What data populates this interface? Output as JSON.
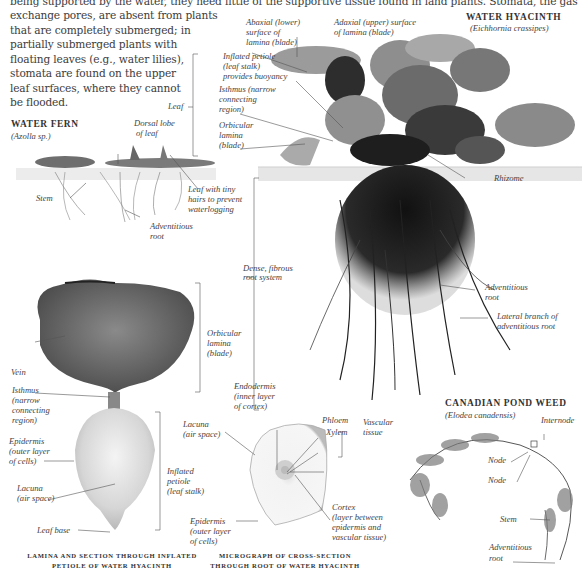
{
  "intro_text": {
    "lines": [
      "being supported by the water, they need little of the supportive tissue found in land plants. Stomata, the gas",
      "exchange pores, are absent from plants",
      "that are completely submerged; in",
      "partially submerged plants with",
      "floating leaves (e.g., water lilies),",
      "stomata are found on the upper",
      "leaf surfaces, where they cannot",
      "be flooded."
    ]
  },
  "water_hyacinth": {
    "title": "WATER HYACINTH",
    "species": "(Eichhornia crassipes)",
    "labels": {
      "abaxial": [
        "Abaxial (lower)",
        "surface of",
        "lamina (blade)"
      ],
      "adaxial": [
        "Adaxial (upper) surface",
        "of lamina (blade)"
      ],
      "inflated_petiole": [
        "Inflated petiole",
        "(leaf stalk)",
        "provides buoyancy"
      ],
      "isthmus": [
        "Isthmus (narrow",
        "connecting",
        "region)"
      ],
      "orbicular": [
        "Orbicular",
        "lamina",
        "(blade)"
      ],
      "leaf": "Leaf",
      "rhizome": "Rhizome",
      "dense_root": [
        "Dense, fibrous",
        "root system"
      ],
      "adventitious_root": [
        "Adventitious",
        "root"
      ],
      "lateral_branch": [
        "Lateral branch of",
        "adventitious root"
      ]
    }
  },
  "water_fern": {
    "title": "WATER FERN",
    "species": "(Azolla sp.)",
    "labels": {
      "dorsal_lobe": [
        "Dorsal lobe",
        "of leaf"
      ],
      "stem": "Stem",
      "leaf_hairs": [
        "Leaf with tiny",
        "hairs to prevent",
        "waterlogging"
      ],
      "adventitious_root": [
        "Adventitious",
        "root"
      ]
    }
  },
  "lamina_section": {
    "labels": {
      "orbicular": [
        "Orbicular",
        "lamina",
        "(blade)"
      ],
      "vein": "Vein",
      "isthmus": [
        "Isthmus",
        "(narrow",
        "connecting",
        "region)"
      ],
      "epidermis": [
        "Epidermis",
        "(outer layer",
        "of cells)"
      ],
      "lacuna": [
        "Lacuna",
        "(air space)"
      ],
      "inflated_petiole": [
        "Inflated",
        "petiole",
        "(leaf stalk)"
      ],
      "leaf_base": "Leaf base"
    },
    "caption": [
      "LAMINA AND SECTION THROUGH INFLATED",
      "PETIOLE OF WATER HYACINTH"
    ]
  },
  "root_micrograph": {
    "labels": {
      "endodermis": [
        "Endodermis",
        "(inner layer",
        "of cortex)"
      ],
      "lacuna": [
        "Lacuna",
        "(air space)"
      ],
      "phloem": "Phloem",
      "xylem": "Xylem",
      "vascular": [
        "Vascular",
        "tissue"
      ],
      "cortex": [
        "Cortex",
        "(layer between",
        "epidermis and",
        "vascular tissue)"
      ],
      "epidermis": [
        "Epidermis",
        "(outer layer",
        "of cells)"
      ]
    },
    "caption": [
      "MICROGRAPH OF CROSS-SECTION",
      "THROUGH ROOT OF WATER HYACINTH"
    ]
  },
  "pond_weed": {
    "title": "CANADIAN POND WEED",
    "species": "(Elodea canadensis)",
    "labels": {
      "internode": "Internode",
      "node1": "Node",
      "node2": "Node",
      "stem": "Stem",
      "adventitious_root": [
        "Adventitious",
        "root"
      ]
    }
  },
  "colors": {
    "background": "#ffffff",
    "text": "#3c3c3c",
    "leader_line": "#555555",
    "water_band": "#e8e8e8"
  }
}
